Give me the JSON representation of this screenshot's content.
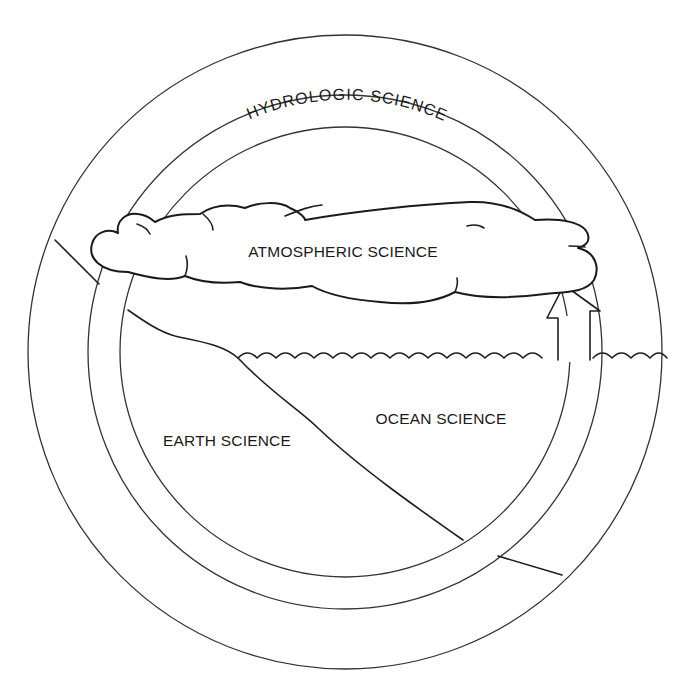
{
  "diagram": {
    "arc_label": "HYDROLOGIC   SCIENCE",
    "regions": {
      "atmosphere": "ATMOSPHERIC SCIENCE",
      "ocean": "OCEAN SCIENCE",
      "earth": "EARTH SCIENCE"
    },
    "icons": {
      "arrow": "cycle-arrow",
      "cloud": "cloud",
      "waves": "ocean-waves"
    },
    "colors": {
      "line": "#1f1f1f",
      "background": "#ffffff"
    }
  }
}
